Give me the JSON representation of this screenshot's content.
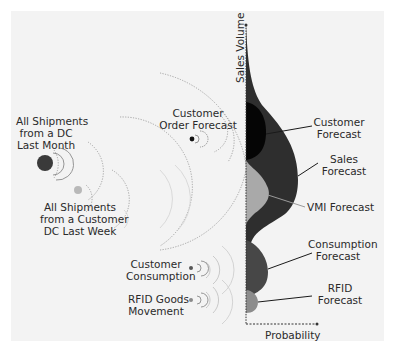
{
  "diagram": {
    "axes": {
      "y_label": "Sales Volume",
      "x_label": "Probability"
    },
    "sources": [
      {
        "id": "dc-last-month",
        "lines": [
          "All Shipments",
          "from a DC",
          "Last Month"
        ],
        "dot_color": "#3a3a3a"
      },
      {
        "id": "customer-dc-last-week",
        "lines": [
          "All Shipments",
          "from a Customer",
          "DC Last Week"
        ],
        "dot_color": "#b8b8b8"
      },
      {
        "id": "customer-order-forecast",
        "lines": [
          "Customer",
          "Order Forecast"
        ],
        "dot_color": "#111111"
      },
      {
        "id": "customer-consumption",
        "lines": [
          "Customer",
          "Consumption"
        ],
        "dot_color": "#555555"
      },
      {
        "id": "rfid-goods-movement",
        "lines": [
          "RFID Goods",
          "Movement"
        ],
        "dot_color": "#8a8a8a"
      }
    ],
    "forecasts": [
      {
        "id": "customer-forecast",
        "lines": [
          "Customer",
          "Forecast"
        ],
        "color": "#050505"
      },
      {
        "id": "sales-forecast",
        "lines": [
          "Sales",
          "Forecast"
        ],
        "color": "#2e2e2e"
      },
      {
        "id": "vmi-forecast",
        "lines": [
          "VMI Forecast"
        ],
        "color": "#a9a9a9"
      },
      {
        "id": "consumption-forecast",
        "lines": [
          "Consumption",
          "Forecast"
        ],
        "color": "#474747"
      },
      {
        "id": "rfid-forecast",
        "lines": [
          "RFID",
          "Forecast"
        ],
        "color": "#8c8c8c"
      }
    ],
    "colors": {
      "background": "#f3f3f3",
      "arc": "#9a9a9a",
      "axis": "#333333"
    }
  }
}
